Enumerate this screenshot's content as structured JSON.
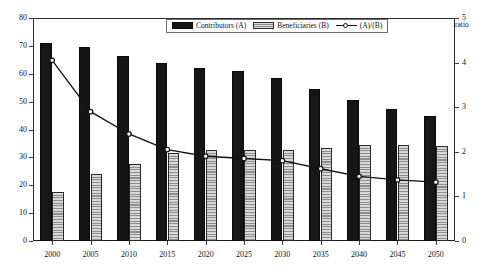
{
  "axes": {
    "left_unit": "million",
    "right_unit": "ratio",
    "left_ticks": [
      "0",
      "10",
      "20",
      "30",
      "40",
      "50",
      "60",
      "70",
      "80"
    ],
    "right_ticks": [
      "0",
      "1",
      "2",
      "3",
      "4",
      "5"
    ]
  },
  "legend": {
    "items": [
      {
        "label": "Contributors (A)",
        "swatch": "black-bar-swatch"
      },
      {
        "label": "Beneficiaries (B)",
        "swatch": "hatched-bar-swatch"
      },
      {
        "label": "(A)/(B)",
        "swatch": "line-marker-swatch"
      }
    ]
  },
  "chart_data": {
    "type": "bar",
    "title": "",
    "subtitle": "",
    "xlabel": "",
    "ylabel": "million",
    "y2label": "ratio",
    "grid": false,
    "legend_position": "top-center",
    "categories": [
      "2000",
      "2005",
      "2010",
      "2015",
      "2020",
      "2025",
      "2030",
      "2035",
      "2040",
      "2045",
      "2050"
    ],
    "ylim": [
      0,
      80
    ],
    "y2lim": [
      0,
      5
    ],
    "ytick_step": 10,
    "y2tick_step": 1,
    "series": [
      {
        "name": "Contributors (A)",
        "axis": "left",
        "type": "bar",
        "color": "#161616",
        "values": [
          71,
          69.5,
          66.5,
          64,
          62,
          61,
          58.5,
          54.5,
          50.5,
          47.5,
          45
        ]
      },
      {
        "name": "Beneficiaries (B)",
        "axis": "left",
        "type": "bar",
        "color": "#b4b4b4",
        "values": [
          17.5,
          24,
          27.5,
          31.5,
          32.5,
          32.5,
          32.5,
          33.5,
          34.5,
          34.5,
          34
        ]
      },
      {
        "name": "(A)/(B)",
        "axis": "right",
        "type": "line",
        "color": "#111111",
        "values": [
          4.05,
          2.9,
          2.4,
          2.05,
          1.9,
          1.85,
          1.8,
          1.62,
          1.45,
          1.37,
          1.32
        ]
      }
    ]
  }
}
